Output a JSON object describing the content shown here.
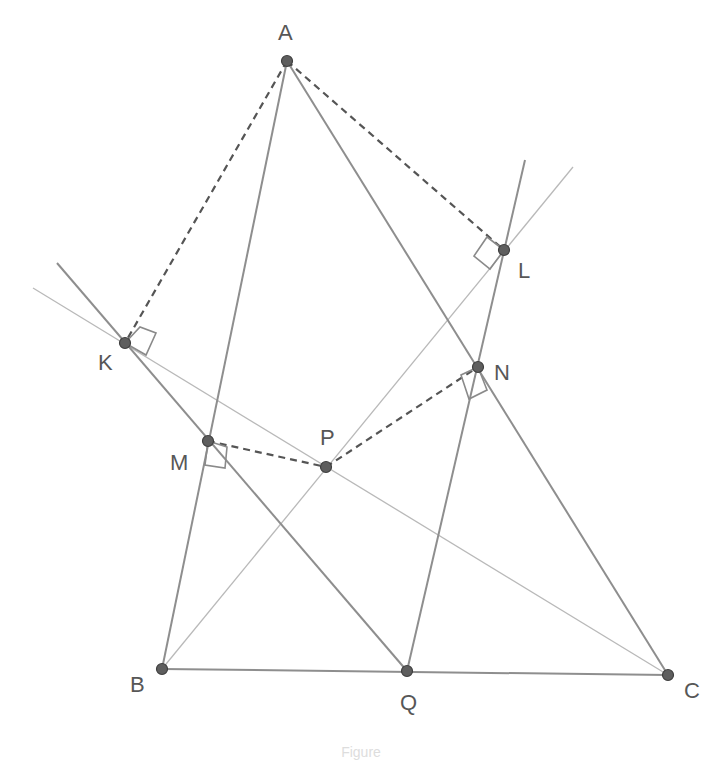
{
  "diagram": {
    "points": {
      "A": {
        "label": "A",
        "x": 287,
        "y": 61,
        "label_x": 278,
        "label_y": 40
      },
      "B": {
        "label": "B",
        "x": 162,
        "y": 669,
        "label_x": 130,
        "label_y": 692
      },
      "C": {
        "label": "C",
        "x": 668,
        "y": 675,
        "label_x": 684,
        "label_y": 698
      },
      "Q": {
        "label": "Q",
        "x": 407,
        "y": 671,
        "label_x": 400,
        "label_y": 710
      },
      "K": {
        "label": "K",
        "x": 125,
        "y": 343,
        "label_x": 98,
        "label_y": 370
      },
      "L": {
        "label": "L",
        "x": 504,
        "y": 250,
        "label_x": 518,
        "label_y": 278
      },
      "M": {
        "label": "M",
        "x": 208,
        "y": 441,
        "label_x": 170,
        "label_y": 470
      },
      "N": {
        "label": "N",
        "x": 478,
        "y": 367,
        "label_x": 494,
        "label_y": 380
      },
      "P": {
        "label": "P",
        "x": 326,
        "y": 467,
        "label_x": 320,
        "label_y": 445
      }
    },
    "segments_thick": [
      {
        "name": "side-AB",
        "from": "A",
        "to": "B"
      },
      {
        "name": "side-AC",
        "from": "A",
        "to": "C"
      },
      {
        "name": "side-BC",
        "from": "B",
        "to": "C"
      }
    ],
    "lines_thick": [
      {
        "name": "line-KQ",
        "x1": 57,
        "y1": 263,
        "x2": 407,
        "y2": 671
      },
      {
        "name": "line-LQ",
        "x1": 525,
        "y1": 160,
        "x2": 407,
        "y2": 671
      }
    ],
    "lines_thin": [
      {
        "name": "line-KC",
        "x1": 33,
        "y1": 288,
        "x2": 668,
        "y2": 675
      },
      {
        "name": "line-BL",
        "x1": 162,
        "y1": 669,
        "x2": 573,
        "y2": 167
      }
    ],
    "segments_dashed": [
      {
        "name": "perp-AK",
        "from": "A",
        "to": "K"
      },
      {
        "name": "perp-AL",
        "from": "A",
        "to": "L"
      },
      {
        "name": "segment-MP",
        "from": "M",
        "to": "P"
      },
      {
        "name": "segment-PN",
        "from": "P",
        "to": "N"
      }
    ],
    "right_angle_marks": [
      {
        "name": "right-angle-K",
        "points": "125,343 140,327 156,333 146,355"
      },
      {
        "name": "right-angle-L",
        "points": "504,250 487,237 474,256 490,269"
      },
      {
        "name": "right-angle-M",
        "points": "208,441 227,447 225,468 205,465"
      },
      {
        "name": "right-angle-N",
        "points": "478,367 461,375 469,399 487,390"
      }
    ],
    "caption": "Figure"
  }
}
